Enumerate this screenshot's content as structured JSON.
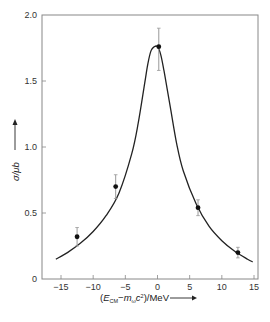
{
  "chart_data": {
    "type": "scatter",
    "title": "",
    "xlabel": "(E_CM − m_ω c²)/MeV",
    "xlabel_parts": {
      "open": "(",
      "E": "E",
      "E_sub": "CM",
      "minus": "−m",
      "m_sub": "ω",
      "c": "c",
      "c_sup": "2",
      "close": ")/MeV"
    },
    "ylabel": "σ/μb",
    "xlim": [
      -17,
      16.5
    ],
    "ylim": [
      0,
      2.0
    ],
    "x_ticks": [
      -15,
      -10,
      -5,
      0,
      5,
      10,
      15
    ],
    "x_tick_labels": [
      "−15",
      "−10",
      "−5",
      "0",
      "5",
      "10",
      "15"
    ],
    "y_ticks": [
      0,
      0.5,
      1.0,
      1.5,
      2.0
    ],
    "y_tick_labels": [
      "0",
      "0.5",
      "1.0",
      "1.5",
      "2.0"
    ],
    "grid": false,
    "legend": null,
    "series": [
      {
        "name": "measured cross-section",
        "kind": "points_with_error_bars",
        "points": [
          {
            "x": -12.5,
            "y": 0.32,
            "err_low": 0.25,
            "err_high": 0.39
          },
          {
            "x": -6.5,
            "y": 0.7,
            "err_low": 0.61,
            "err_high": 0.79
          },
          {
            "x": 0.2,
            "y": 1.76,
            "err_low": 1.58,
            "err_high": 1.9
          },
          {
            "x": 6.3,
            "y": 0.54,
            "err_low": 0.48,
            "err_high": 0.6
          },
          {
            "x": 12.5,
            "y": 0.2,
            "err_low": 0.16,
            "err_high": 0.24
          }
        ]
      },
      {
        "name": "resonance fit curve",
        "kind": "line",
        "x": [
          -15.8,
          -14,
          -12,
          -10,
          -8,
          -6,
          -4,
          -3,
          -2,
          -1.5,
          -1,
          -0.5,
          0,
          0.5,
          1,
          1.5,
          2,
          3,
          4,
          6,
          8,
          10,
          12,
          14,
          14.8
        ],
        "y": [
          0.15,
          0.2,
          0.27,
          0.36,
          0.48,
          0.65,
          0.95,
          1.18,
          1.48,
          1.63,
          1.73,
          1.76,
          1.76,
          1.7,
          1.58,
          1.44,
          1.3,
          1.02,
          0.82,
          0.57,
          0.4,
          0.29,
          0.21,
          0.15,
          0.13
        ]
      }
    ]
  },
  "colors": {
    "axis": "#888888",
    "curve": "#222222",
    "points": "#111111",
    "error_bars": "#999999",
    "text": "#333333"
  }
}
